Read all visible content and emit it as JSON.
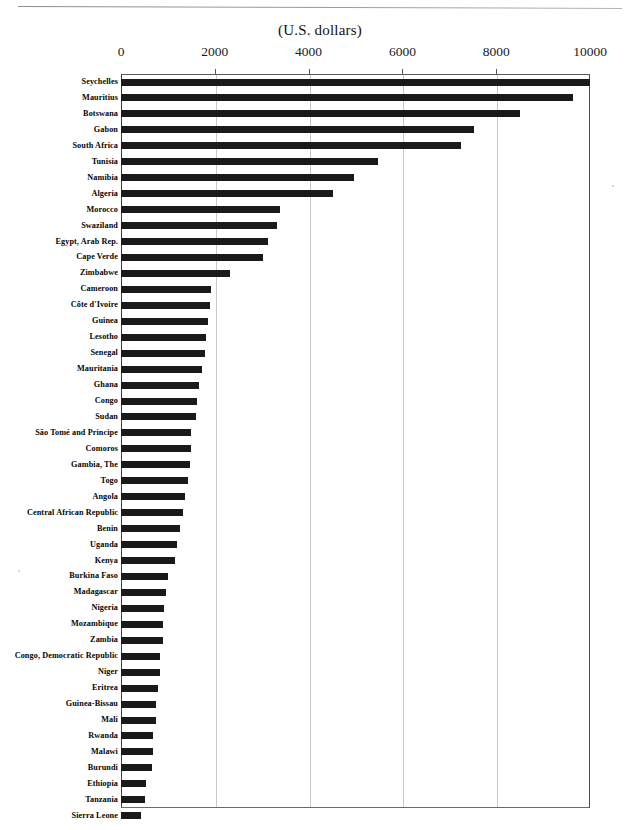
{
  "chart_data": {
    "type": "bar",
    "orientation": "horizontal",
    "title": "(U.S.  dollars)",
    "xlabel": "(U.S.  dollars)",
    "ylabel": "",
    "xlim": [
      0,
      10000
    ],
    "xticks": [
      0,
      2000,
      4000,
      6000,
      8000,
      10000
    ],
    "xtick_labels": [
      "0",
      "2000",
      "4000",
      "6000",
      "8000",
      "10000"
    ],
    "grid": true,
    "legend": "none",
    "bar_color": "#1a1a1a",
    "categories": [
      "Seychelles",
      "Mauritius",
      "Botswana",
      "Gabon",
      "South Africa",
      "Tunisia",
      "Namibia",
      "Algeria",
      "Morocco",
      "Swaziland",
      "Egypt,  Arab Rep.",
      "Cape Verde",
      "Zimbabwe",
      "Cameroon",
      "Côte d'Ivoire",
      "Guinea",
      "Lesotho",
      "Senegal",
      "Mauritania",
      "Ghana",
      "Congo",
      "Sudan",
      "São Tomé and Principe",
      "Comoros",
      "Gambia, The",
      "Togo",
      "Angola",
      "Central African Republic",
      "Benin",
      "Uganda",
      "Kenya",
      "Burkina Faso",
      "Madagascar",
      "Nigeria",
      "Mozambique",
      "Zambia",
      "Congo, Democratic  Republic",
      "Niger",
      "Eritrea",
      "Guinea-Bissau",
      "Mali",
      "Rwanda",
      "Malawi",
      "Burundi",
      "Ethiopia",
      "Tanzania",
      "Sierra Leone"
    ],
    "values": [
      10000,
      9640,
      8500,
      7530,
      7250,
      5470,
      4960,
      4530,
      3400,
      3320,
      3130,
      3020,
      2330,
      1910,
      1890,
      1850,
      1810,
      1790,
      1720,
      1660,
      1620,
      1600,
      1490,
      1490,
      1470,
      1430,
      1360,
      1320,
      1260,
      1190,
      1150,
      1000,
      960,
      920,
      900,
      890,
      830,
      830,
      790,
      750,
      750,
      680,
      680,
      660,
      530,
      510,
      430
    ]
  }
}
